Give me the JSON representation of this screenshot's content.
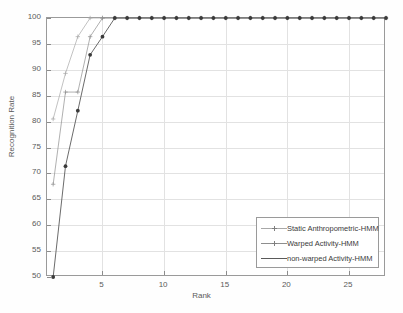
{
  "chart_data": {
    "type": "line",
    "title": "",
    "xlabel": "Rank",
    "ylabel": "Recognition Rate",
    "xlim": [
      0.5,
      28
    ],
    "ylim": [
      50,
      100
    ],
    "xticks": [
      5,
      10,
      15,
      20,
      25
    ],
    "yticks": [
      50,
      55,
      60,
      65,
      70,
      75,
      80,
      85,
      90,
      95,
      100
    ],
    "grid": true,
    "legend_position": "lower right",
    "series": [
      {
        "name": "Static Anthropometric-HMM",
        "color": "#a8a8a8",
        "marker": "plus",
        "x": [
          1,
          2,
          3,
          4,
          5,
          6,
          7,
          8,
          9,
          10,
          11,
          12,
          13,
          14,
          15,
          16,
          17,
          18,
          19,
          20,
          21,
          22,
          23,
          24,
          25,
          26,
          27,
          28
        ],
        "y": [
          80.5,
          89.3,
          96.4,
          100,
          100,
          100,
          100,
          100,
          100,
          100,
          100,
          100,
          100,
          100,
          100,
          100,
          100,
          100,
          100,
          100,
          100,
          100,
          100,
          100,
          100,
          100,
          100,
          100
        ]
      },
      {
        "name": "Warped Activity-HMM",
        "color": "#8e8e8e",
        "marker": "plus",
        "x": [
          1,
          2,
          3,
          4,
          5,
          6,
          7,
          8,
          9,
          10,
          11,
          12,
          13,
          14,
          15,
          16,
          17,
          18,
          19,
          20,
          21,
          22,
          23,
          24,
          25,
          26,
          27,
          28
        ],
        "y": [
          67.9,
          85.7,
          85.7,
          96.4,
          100,
          100,
          100,
          100,
          100,
          100,
          100,
          100,
          100,
          100,
          100,
          100,
          100,
          100,
          100,
          100,
          100,
          100,
          100,
          100,
          100,
          100,
          100,
          100
        ]
      },
      {
        "name": "non-warped Activity-HMM",
        "color": "#5a5a5a",
        "marker": "dot",
        "x": [
          1,
          2,
          3,
          4,
          5,
          6,
          7,
          8,
          9,
          10,
          11,
          12,
          13,
          14,
          15,
          16,
          17,
          18,
          19,
          20,
          21,
          22,
          23,
          24,
          25,
          26,
          27,
          28
        ],
        "y": [
          50.0,
          71.4,
          82.1,
          92.9,
          96.4,
          100,
          100,
          100,
          100,
          100,
          100,
          100,
          100,
          100,
          100,
          100,
          100,
          100,
          100,
          100,
          100,
          100,
          100,
          100,
          100,
          100,
          100,
          100
        ]
      }
    ]
  },
  "legend": {
    "entries": [
      {
        "label": "Static Anthropometric-HMM"
      },
      {
        "label": "Warped Activity-HMM"
      },
      {
        "label": "non-warped Activity-HMM"
      }
    ]
  }
}
